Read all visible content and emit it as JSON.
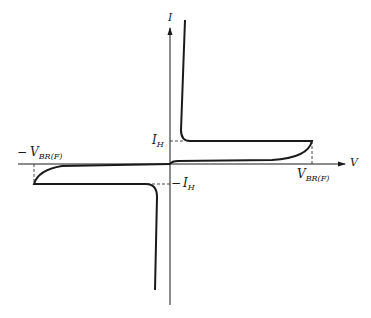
{
  "diagram": {
    "type": "i-v-characteristic",
    "axes": {
      "x_label": "V",
      "y_label": "I"
    },
    "labels": {
      "holding_current_pos_main": "I",
      "holding_current_pos_sub": "H",
      "holding_current_neg_prefix": "−",
      "holding_current_neg_main": "I",
      "holding_current_neg_sub": "H",
      "breakover_pos_main": "V",
      "breakover_pos_sub": "BR(F)",
      "breakover_neg_prefix": "−",
      "breakover_neg_main": "V",
      "breakover_neg_sub": "BR(F)"
    },
    "colors": {
      "stroke": "#1a1a1a",
      "background": "#ffffff"
    }
  }
}
